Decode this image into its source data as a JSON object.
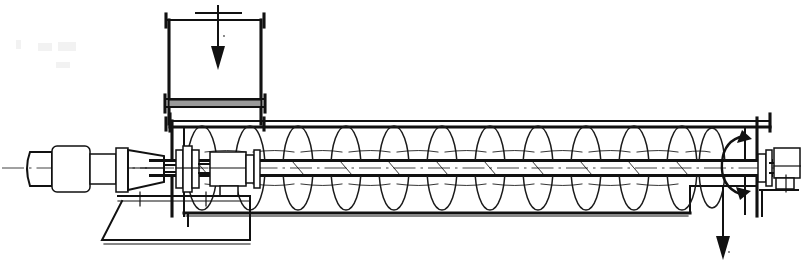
{
  "drawing": {
    "title": "Screw Conveyor Assembly",
    "type": "engineering-line-drawing",
    "view": "longitudinal-section-elevation",
    "style": "monochrome black line art on white",
    "canvas": {
      "width": 801,
      "height": 264
    },
    "colors": {
      "background": "#ffffff",
      "line": "#111111",
      "flange_shading": "#9a9a9a",
      "scan_artifact": "#e9e9e9"
    }
  },
  "flow": {
    "inlet_arrow": {
      "name": "material-inlet-arrow",
      "direction": "down",
      "x": 218,
      "y_from": 6,
      "y_to": 68
    },
    "inlet_arrow_cross_y": 13,
    "discharge_arrow": {
      "name": "material-discharge-arrow",
      "direction": "down",
      "x": 723,
      "y_from": 186,
      "y_to": 258
    },
    "rotation_arrow": {
      "name": "shaft-rotation-arrow",
      "shape": "curved-c-arrow",
      "cx": 740,
      "cy": 162,
      "direction": "clockwise"
    }
  },
  "components": {
    "motor": {
      "label": "drive-motor",
      "x": 28,
      "y": 148,
      "width": 52,
      "height": 40
    },
    "gear_reducer": {
      "label": "gear-reducer",
      "x": 88,
      "y": 144,
      "width": 48,
      "height": 46
    },
    "coupling": {
      "label": "shaft-coupling",
      "x": 122,
      "y": 150,
      "width": 30,
      "height": 34
    },
    "drive_bearing": {
      "label": "drive-end-bearing",
      "x": 148,
      "y": 152,
      "width": 30,
      "height": 32
    },
    "pedestal": {
      "label": "drive-pedestal-base",
      "x": 62,
      "y": 196,
      "width": 110,
      "height": 46
    },
    "trough": {
      "label": "conveyor-trough",
      "x": 170,
      "y": 124,
      "width": 600,
      "height": 90
    },
    "inlet_hopper": {
      "label": "inlet-hopper-chute",
      "x": 166,
      "y": 10,
      "width": 98,
      "height": 114
    },
    "hopper_flange": {
      "label": "hopper-flange-band",
      "x": 166,
      "y": 100,
      "width": 98,
      "height": 7
    },
    "discharge_opening": {
      "label": "discharge-outlet",
      "x": 690,
      "y": 186,
      "width": 66,
      "height": 28
    },
    "end_bearing": {
      "label": "tail-end-bearing",
      "x": 762,
      "y": 148,
      "width": 32,
      "height": 34
    },
    "screw_shaft": {
      "label": "screw-shaft-pipe",
      "x": 150,
      "y": 160,
      "width": 620,
      "height": 16
    },
    "centerline": {
      "label": "shaft-centerline",
      "y": 168,
      "x_from": 2,
      "x_to": 799
    }
  },
  "screw": {
    "label": "helical-screw-flighting",
    "flight_count": 12,
    "flight_pitch": 48,
    "flight_first_x": 202,
    "flight_rx": 15,
    "flight_ry": 42,
    "flight_cy": 168,
    "hand": "right-hand-helix"
  },
  "supports": {
    "trough_left_leg_x": 184,
    "trough_bottom_y": 213,
    "trough_top_y": 124
  },
  "artifacts": [
    {
      "name": "scan-smudge-upper-left",
      "x": 14,
      "y": 40,
      "width": 64,
      "height": 10
    },
    {
      "name": "scan-smudge-lower",
      "x": 54,
      "y": 62,
      "width": 22,
      "height": 7
    }
  ]
}
